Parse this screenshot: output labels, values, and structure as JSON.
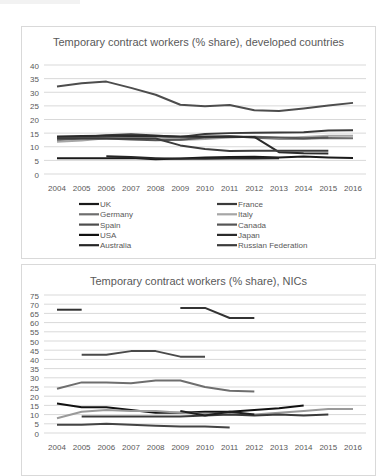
{
  "chart_data": [
    {
      "type": "line",
      "title": "Temporary contract workers (% share), developed countries",
      "xlabel": "",
      "ylabel": "",
      "ylim": [
        0,
        40
      ],
      "yticks": [
        0,
        5,
        10,
        15,
        20,
        25,
        30,
        35,
        40
      ],
      "grid": true,
      "legend_position": "bottom",
      "x": [
        2004,
        2005,
        2006,
        2007,
        2008,
        2009,
        2010,
        2011,
        2012,
        2013,
        2014,
        2015,
        2016
      ],
      "series": [
        {
          "name": "UK",
          "color": "#1a1a1a",
          "values": [
            5.8,
            5.8,
            5.8,
            5.9,
            5.4,
            5.7,
            6.1,
            6.2,
            6.3,
            6.1,
            6.4,
            6.1,
            5.9
          ]
        },
        {
          "name": "France",
          "color": "#3a3a3a",
          "values": [
            13.2,
            13.6,
            14.2,
            14.6,
            14.1,
            13.6,
            14.7,
            15.0,
            15.1,
            15.2,
            15.3,
            16.0,
            16.1
          ]
        },
        {
          "name": "Germany",
          "color": "#6e6e6e",
          "values": [
            12.4,
            13.0,
            13.6,
            13.8,
            13.3,
            13.3,
            13.8,
            13.9,
            13.3,
            12.9,
            12.9,
            13.2,
            13.1
          ]
        },
        {
          "name": "Italy",
          "color": "#a6a6a6",
          "values": [
            11.8,
            12.3,
            13.1,
            13.2,
            13.3,
            12.5,
            12.8,
            13.4,
            13.8,
            13.2,
            13.6,
            14.0,
            14.0
          ]
        },
        {
          "name": "Spain",
          "color": "#4d4d4d",
          "values": [
            32.1,
            33.3,
            33.9,
            31.6,
            29.1,
            25.4,
            24.9,
            25.3,
            23.4,
            23.1,
            24.0,
            25.1,
            26.1
          ]
        },
        {
          "name": "Canada",
          "color": "#555555",
          "values": [
            13.1,
            13.2,
            13.0,
            12.7,
            12.4,
            12.6,
            13.4,
            13.7,
            13.6,
            13.4,
            13.1,
            13.4,
            null
          ]
        },
        {
          "name": "USA",
          "color": "#111111",
          "values": [
            null,
            4.2,
            null,
            null,
            null,
            null,
            null,
            null,
            null,
            null,
            null,
            null,
            null
          ]
        },
        {
          "name": "Japan",
          "color": "#2b2b2b",
          "values": [
            13.8,
            13.9,
            14.0,
            13.9,
            13.9,
            13.8,
            13.7,
            13.7,
            13.6,
            8.0,
            7.6,
            7.5,
            null
          ]
        },
        {
          "name": "Australia",
          "color": "#262626",
          "values": [
            null,
            null,
            6.5,
            6.2,
            5.8,
            5.6,
            5.6,
            5.7,
            5.7,
            5.8,
            null,
            null,
            null
          ]
        },
        {
          "name": "Russian Federation",
          "color": "#3c3c3c",
          "values": [
            13.0,
            13.0,
            13.0,
            13.0,
            13.0,
            10.5,
            9.2,
            8.4,
            8.5,
            8.5,
            8.5,
            8.5,
            null
          ]
        }
      ]
    },
    {
      "type": "line",
      "title": "Temporary contract workers (% share), NICs",
      "xlabel": "",
      "ylabel": "",
      "ylim": [
        0,
        75
      ],
      "yticks": [
        0,
        5,
        10,
        15,
        20,
        25,
        30,
        35,
        40,
        45,
        50,
        55,
        60,
        65,
        70,
        75
      ],
      "grid": true,
      "x": [
        2004,
        2005,
        2006,
        2007,
        2008,
        2009,
        2010,
        2011,
        2012,
        2013,
        2014,
        2015,
        2016
      ],
      "series": [
        {
          "name": "Series A",
          "color": "#333333",
          "values": [
            67,
            67,
            null,
            null,
            null,
            68,
            68,
            62.5,
            62.5,
            null,
            null,
            null,
            null
          ]
        },
        {
          "name": "Series B",
          "color": "#4a4a4a",
          "values": [
            null,
            42.5,
            42.5,
            44.5,
            44.5,
            41.5,
            41.5,
            null,
            null,
            null,
            null,
            null,
            null
          ]
        },
        {
          "name": "Series C",
          "color": "#6e6e6e",
          "values": [
            24,
            27.5,
            27.5,
            27,
            28.5,
            28.5,
            25,
            23,
            22.5,
            null,
            null,
            null,
            null
          ]
        },
        {
          "name": "Series D",
          "color": "#111111",
          "values": [
            16,
            14,
            14,
            12.5,
            11,
            11,
            11.5,
            11.5,
            12.5,
            13.5,
            15,
            null,
            null
          ]
        },
        {
          "name": "Series E",
          "color": "#9a9a9a",
          "values": [
            8,
            11.5,
            12.5,
            12,
            12,
            11,
            10.5,
            10,
            10,
            11,
            12,
            13,
            13
          ]
        },
        {
          "name": "Series F",
          "color": "#3a3a3a",
          "values": [
            null,
            9,
            9,
            9,
            9,
            9,
            9.5,
            10,
            9.5,
            10,
            9.5,
            10,
            null
          ]
        },
        {
          "name": "Series G",
          "color": "#1f1f1f",
          "values": [
            null,
            null,
            null,
            null,
            null,
            12,
            9.5,
            11.5,
            10,
            null,
            null,
            null,
            null
          ]
        },
        {
          "name": "Series H",
          "color": "#444444",
          "values": [
            4.5,
            4.5,
            5,
            4.5,
            4,
            3.5,
            3.5,
            3,
            null,
            null,
            null,
            null,
            null
          ]
        }
      ]
    }
  ],
  "charts": {
    "developed": {
      "title": "Temporary contract workers (% share), developed countries",
      "legend": [
        "UK",
        "France",
        "Germany",
        "Italy",
        "Spain",
        "Canada",
        "USA",
        "Japan",
        "Australia",
        "Russian Federation"
      ]
    },
    "nics": {
      "title": "Temporary contract workers (% share), NICs"
    }
  }
}
